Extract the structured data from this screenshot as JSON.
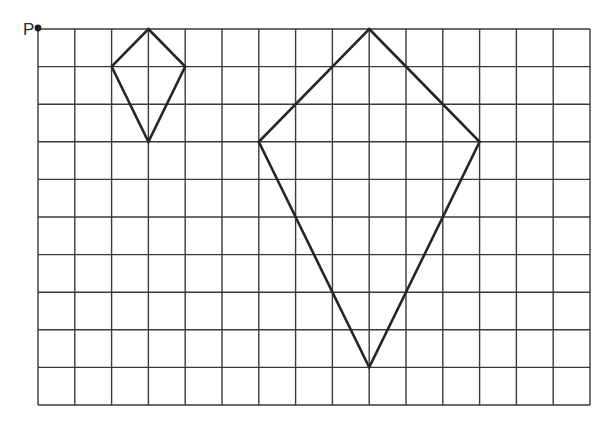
{
  "diagram": {
    "origin_label": "P",
    "grid": {
      "columns": 15,
      "rows": 10,
      "origin_px": [
        38,
        29
      ],
      "cell_width_px": 36.8,
      "cell_height_px": 37.6,
      "line_color": "#3a3a3a"
    },
    "shapes": [
      {
        "name": "small-kite",
        "vertices_grid": [
          [
            3,
            0
          ],
          [
            4,
            1
          ],
          [
            3,
            3
          ],
          [
            2,
            1
          ]
        ]
      },
      {
        "name": "large-kite",
        "vertices_grid": [
          [
            9,
            0
          ],
          [
            12,
            3
          ],
          [
            9,
            9
          ],
          [
            6,
            3
          ]
        ]
      }
    ],
    "point": {
      "label": "P",
      "grid": [
        0,
        0
      ]
    }
  }
}
